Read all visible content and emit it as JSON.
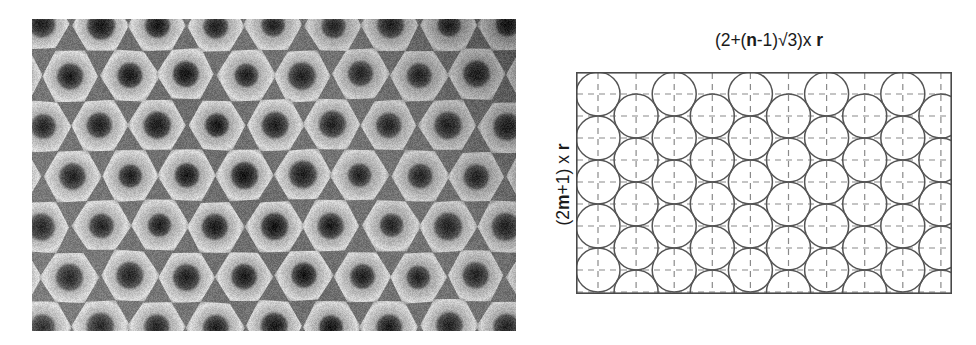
{
  "figure": {
    "caption_present": false,
    "background_color": "#ffffff"
  },
  "micrograph": {
    "name": "sem-micrograph",
    "description": "grayscale SEM micrograph of hexagonally ordered pore array",
    "x": 32,
    "y": 19,
    "width": 484,
    "height": 312,
    "palette": {
      "rim_light": "#d8d8d8",
      "mid_gray": "#8e8e8e",
      "cell_dark": "#2a2a2a",
      "core_black": "#101010",
      "background": "#6d6d6d"
    },
    "lattice": {
      "type": "hexagonal",
      "cell_pitch_px": 58,
      "rows": 7,
      "columns": 9,
      "orientation": "flat-top hexagons, rows offset by half pitch"
    },
    "shading": {
      "brightness_gradient": "darker toward upper-right, brighter toward lower-left",
      "vignette": true
    }
  },
  "diagram": {
    "name": "close-packing-schematic",
    "top_label": {
      "full_text": "(2+(n-1)√3)x r",
      "parts": [
        {
          "text": "(2+(",
          "bold": false
        },
        {
          "text": "n",
          "bold": true
        },
        {
          "text": "-1)√3)x ",
          "bold": false
        },
        {
          "text": "r",
          "bold": true
        }
      ]
    },
    "left_label": {
      "full_text": "(2m+1) x r",
      "rotation_deg": -90,
      "parts": [
        {
          "text": "(2",
          "bold": false
        },
        {
          "text": "m",
          "bold": true
        },
        {
          "text": "+1) x ",
          "bold": false
        },
        {
          "text": "r",
          "bold": true
        }
      ]
    },
    "box": {
      "x": 576,
      "y": 72,
      "width": 376,
      "height": 222,
      "stroke": "#4a4a4a",
      "stroke_width": 1.6,
      "fill": "#ffffff"
    },
    "circles": {
      "radius_px": 22,
      "diameter_px": 44,
      "stroke": "#555555",
      "stroke_width": 1.5,
      "fill": "none",
      "columns": 10,
      "column_pitch_px": 38.1,
      "row_pitch_px": 44,
      "column_pattern": "alternating: even columns start at top edge (5 circles), odd columns offset down by one radius (5 circles)",
      "total_count": 50
    },
    "gridlines": {
      "style": "dashed",
      "stroke": "#8a8a8a",
      "stroke_width": 1.2,
      "dash_pattern": "6 5",
      "vertical_count": 10,
      "horizontal_count": 10,
      "description": "dashed construction lines through every circle centre, horizontal and vertical"
    }
  }
}
